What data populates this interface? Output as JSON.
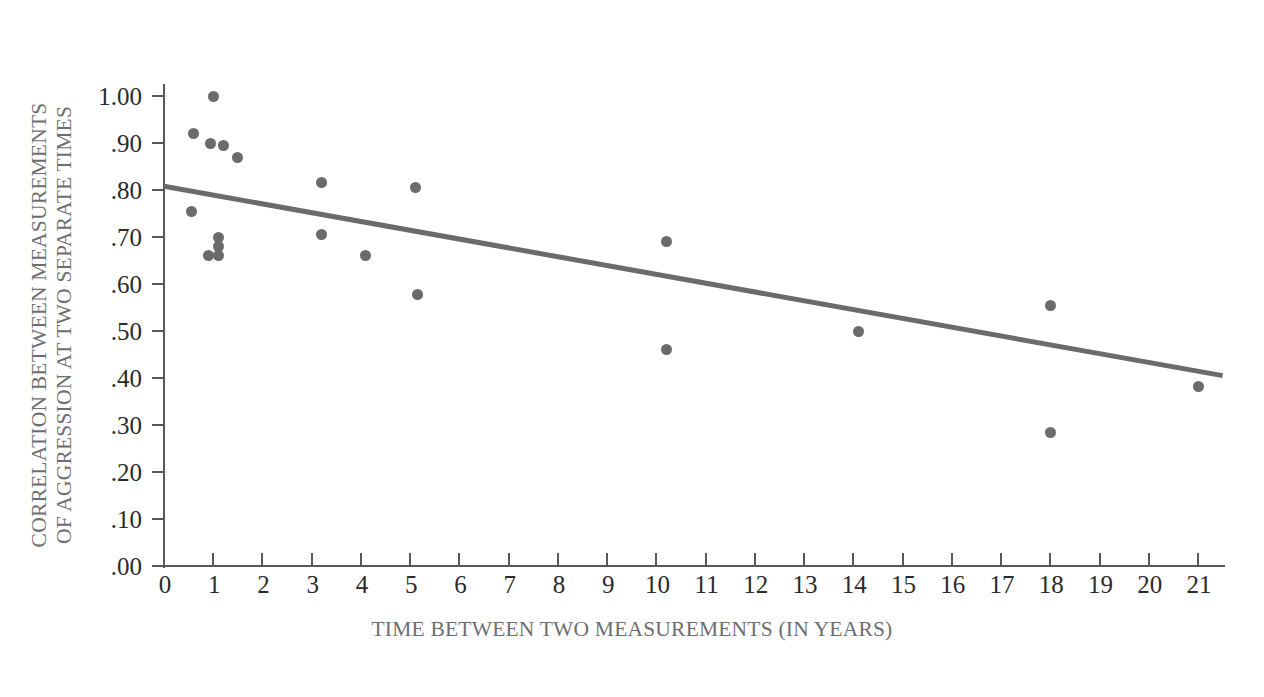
{
  "chart_data": {
    "type": "scatter",
    "title": "",
    "xlabel": "TIME BETWEEN TWO MEASUREMENTS (IN YEARS)",
    "ylabel": "CORRELATION BETWEEN MEASUREMENTS OF AGGRESSION AT TWO SEPARATE TIMES",
    "ylabel_lines": [
      "CORRELATION BETWEEN MEASUREMENTS",
      "OF AGGRESSION AT TWO SEPARATE TIMES"
    ],
    "xlim": [
      0,
      21.5
    ],
    "ylim": [
      0.0,
      1.05
    ],
    "grid": false,
    "legend": null,
    "xticks": [
      0,
      1,
      2,
      3,
      4,
      5,
      6,
      7,
      8,
      9,
      10,
      11,
      12,
      13,
      14,
      15,
      16,
      17,
      18,
      19,
      20,
      21
    ],
    "xtick_labels": [
      "0",
      "1",
      "2",
      "3",
      "4",
      "5",
      "6",
      "7",
      "8",
      "9",
      "10",
      "11",
      "12",
      "13",
      "14",
      "15",
      "16",
      "17",
      "18",
      "19",
      "20",
      "21"
    ],
    "yticks": [
      0.0,
      0.1,
      0.2,
      0.3,
      0.4,
      0.5,
      0.6,
      0.7,
      0.8,
      0.9,
      1.0
    ],
    "ytick_labels": [
      ".00",
      ".10",
      ".20",
      ".30",
      ".40",
      ".50",
      ".60",
      ".70",
      ".80",
      ".90",
      "1.00"
    ],
    "points": [
      {
        "x": 1.0,
        "y": 1.0
      },
      {
        "x": 0.6,
        "y": 0.92
      },
      {
        "x": 0.95,
        "y": 0.9
      },
      {
        "x": 1.2,
        "y": 0.895
      },
      {
        "x": 1.5,
        "y": 0.87
      },
      {
        "x": 0.55,
        "y": 0.755
      },
      {
        "x": 1.1,
        "y": 0.7
      },
      {
        "x": 1.1,
        "y": 0.68
      },
      {
        "x": 0.9,
        "y": 0.66
      },
      {
        "x": 1.1,
        "y": 0.66
      },
      {
        "x": 3.2,
        "y": 0.815
      },
      {
        "x": 3.2,
        "y": 0.705
      },
      {
        "x": 4.1,
        "y": 0.66
      },
      {
        "x": 5.1,
        "y": 0.805
      },
      {
        "x": 5.15,
        "y": 0.578
      },
      {
        "x": 10.2,
        "y": 0.69
      },
      {
        "x": 10.2,
        "y": 0.46
      },
      {
        "x": 14.1,
        "y": 0.5
      },
      {
        "x": 18.0,
        "y": 0.555
      },
      {
        "x": 18.0,
        "y": 0.285
      },
      {
        "x": 21.0,
        "y": 0.382
      }
    ],
    "trend_line": {
      "x0": 0.0,
      "y0": 0.808,
      "x1": 21.5,
      "y1": 0.405
    },
    "colors": {
      "point": "#6b6b6d",
      "trend": "#6b6b6d",
      "axis": "#58585a",
      "tick_label": "#2a2a2c",
      "axis_title": "#6e6e70",
      "background": "#ffffff"
    }
  }
}
